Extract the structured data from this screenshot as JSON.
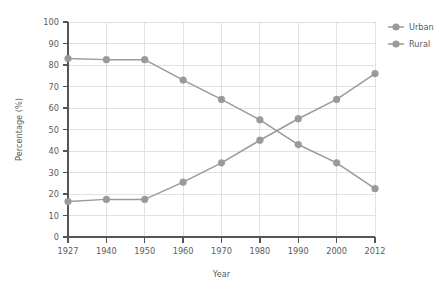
{
  "watermark": {
    "text": ""
  },
  "chart_data": {
    "type": "line",
    "title": "",
    "xlabel": "Year",
    "ylabel": "Percentage (%)",
    "categories": [
      "1927",
      "1940",
      "1950",
      "1960",
      "1970",
      "1980",
      "1990",
      "2000",
      "2012"
    ],
    "x_tick_labels": [
      "1927",
      "1940",
      "1950",
      "1960",
      "1970",
      "1980",
      "1990",
      "2000",
      "2012"
    ],
    "y_tick_labels": [
      "0",
      "10",
      "20",
      "30",
      "40",
      "50",
      "60",
      "70",
      "80",
      "90",
      "100"
    ],
    "ylim": [
      0,
      100
    ],
    "y_step": 10,
    "grid": true,
    "legend_position": "right",
    "series": [
      {
        "name": "Urban",
        "color": "#9a9a9a",
        "marker": "circle",
        "values": [
          16.5,
          17.5,
          17.5,
          25.5,
          34.5,
          45.0,
          55.0,
          64.0,
          76.0
        ]
      },
      {
        "name": "Rural",
        "color": "#9a9a9a",
        "marker": "circle",
        "values": [
          83.0,
          82.5,
          82.5,
          73.0,
          64.0,
          54.5,
          43.0,
          34.5,
          22.5
        ]
      }
    ]
  },
  "colors": {
    "series": "#9a9a9a",
    "axis": "#555555",
    "grid": "#e2e2e2",
    "text": "#5b5b5b",
    "background": "#ffffff"
  }
}
